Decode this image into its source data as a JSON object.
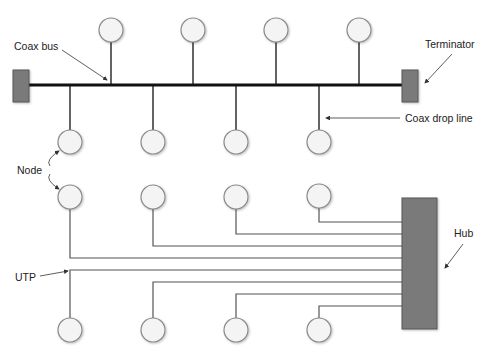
{
  "diagram": {
    "labels": {
      "coax_bus": "Coax bus",
      "terminator": "Terminator",
      "coax_drop_line": "Coax drop line",
      "node": "Node",
      "utp": "UTP",
      "hub": "Hub"
    },
    "bus_topology": {
      "top_node_count": 4,
      "bottom_node_count": 4,
      "terminator_count": 2
    },
    "star_topology": {
      "top_node_count": 4,
      "bottom_node_count": 4,
      "hub_connection_count": 8
    },
    "colors": {
      "node_fill": "#f4f4f4",
      "node_stroke": "#8a8a8a",
      "terminator_fill": "#7a7a7a",
      "hub_fill": "#7a7a7a",
      "bus_line": "#111111",
      "utp_line": "#555555"
    }
  }
}
